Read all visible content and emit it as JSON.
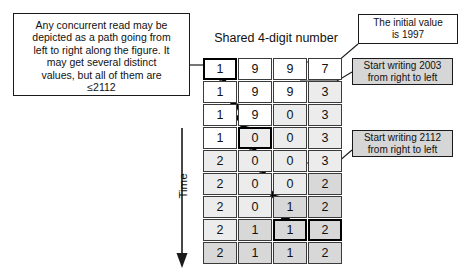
{
  "diagram": {
    "title": "Shared 4-digit number",
    "time_axis_label": "Time",
    "notes": {
      "read_note": {
        "lines": [
          "Any concurrent read may be",
          "depicted as a path going from",
          "left to right along the figure.  It",
          "may get several distinct",
          "values, but all of them are",
          "≤2112"
        ]
      },
      "initial_value": {
        "lines": [
          "The initial value",
          "is 1997"
        ]
      },
      "write_2003": {
        "lines": [
          "Start writing 2003",
          "from right to left"
        ]
      },
      "write_2112": {
        "lines": [
          "Start writing 2112",
          "from right to left"
        ]
      }
    },
    "grid": {
      "columns": 4,
      "rows": [
        {
          "digits": [
            "1",
            "9",
            "9",
            "7"
          ],
          "shades": [
            0,
            0,
            0,
            0
          ],
          "highlight": [
            true,
            false,
            false,
            false
          ]
        },
        {
          "digits": [
            "1",
            "9",
            "9",
            "3"
          ],
          "shades": [
            0,
            0,
            0,
            1
          ],
          "highlight": [
            false,
            false,
            false,
            false
          ]
        },
        {
          "digits": [
            "1",
            "9",
            "0",
            "3"
          ],
          "shades": [
            0,
            0,
            1,
            1
          ],
          "highlight": [
            false,
            false,
            false,
            false
          ]
        },
        {
          "digits": [
            "1",
            "0",
            "0",
            "3"
          ],
          "shades": [
            0,
            1,
            1,
            1
          ],
          "highlight": [
            false,
            true,
            false,
            false
          ]
        },
        {
          "digits": [
            "2",
            "0",
            "0",
            "3"
          ],
          "shades": [
            1,
            1,
            1,
            1
          ],
          "highlight": [
            false,
            false,
            false,
            false
          ]
        },
        {
          "digits": [
            "2",
            "0",
            "0",
            "2"
          ],
          "shades": [
            1,
            1,
            1,
            2
          ],
          "highlight": [
            false,
            false,
            false,
            false
          ]
        },
        {
          "digits": [
            "2",
            "0",
            "1",
            "2"
          ],
          "shades": [
            1,
            1,
            2,
            2
          ],
          "highlight": [
            false,
            false,
            false,
            false
          ]
        },
        {
          "digits": [
            "2",
            "1",
            "1",
            "2"
          ],
          "shades": [
            1,
            2,
            2,
            2
          ],
          "highlight": [
            false,
            false,
            true,
            true
          ]
        },
        {
          "digits": [
            "2",
            "1",
            "1",
            "2"
          ],
          "shades": [
            2,
            2,
            2,
            2
          ],
          "highlight": [
            false,
            false,
            false,
            false
          ]
        }
      ]
    }
  }
}
